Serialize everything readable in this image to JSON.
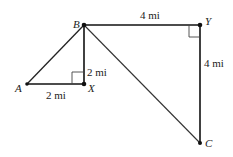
{
  "diagram": {
    "points": {
      "A": {
        "label": "A",
        "x": 27,
        "y": 84
      },
      "B": {
        "label": "B",
        "x": 84,
        "y": 25
      },
      "X": {
        "label": "X",
        "x": 84,
        "y": 84
      },
      "Y": {
        "label": "Y",
        "x": 200,
        "y": 25
      },
      "C": {
        "label": "C",
        "x": 200,
        "y": 143
      }
    },
    "segments": [
      {
        "from": "A",
        "to": "B"
      },
      {
        "from": "A",
        "to": "X"
      },
      {
        "from": "B",
        "to": "X"
      },
      {
        "from": "B",
        "to": "Y"
      },
      {
        "from": "Y",
        "to": "C"
      },
      {
        "from": "B",
        "to": "C"
      }
    ],
    "lengths": {
      "AX": "2 mi",
      "BX": "2 mi",
      "BY": "4 mi",
      "YC": "4 mi"
    },
    "right_angles": [
      "X",
      "Y"
    ],
    "colors": {
      "line": "#222222",
      "background": "#ffffff"
    }
  }
}
